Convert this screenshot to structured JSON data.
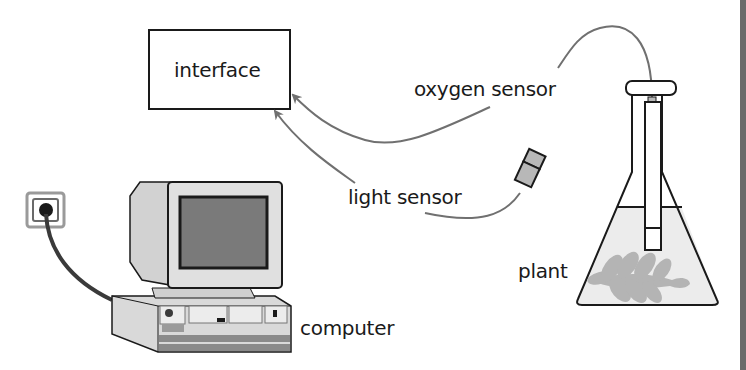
{
  "diagram": {
    "labels": {
      "interface": "interface",
      "oxygen_sensor": "oxygen sensor",
      "light_sensor": "light sensor",
      "plant": "plant",
      "computer": "computer"
    },
    "components": [
      {
        "id": "interface",
        "type": "box"
      },
      {
        "id": "oxygen_sensor",
        "type": "probe",
        "connects_to": "interface"
      },
      {
        "id": "light_sensor",
        "type": "probe",
        "connects_to": "interface"
      },
      {
        "id": "conical_flask",
        "type": "flask",
        "contains": [
          "water",
          "plant",
          "oxygen_sensor"
        ]
      },
      {
        "id": "computer",
        "type": "desktop_pc",
        "connects_to": "power_socket"
      },
      {
        "id": "power_socket",
        "type": "socket"
      }
    ],
    "colors": {
      "line": "#1a1a1a",
      "arrow": "#707070",
      "water": "#ececec",
      "plant": "#b4b4b4",
      "sensor": "#b8b8b8",
      "screen": "#7a7a7a",
      "casing": "#d9d9d9"
    }
  }
}
